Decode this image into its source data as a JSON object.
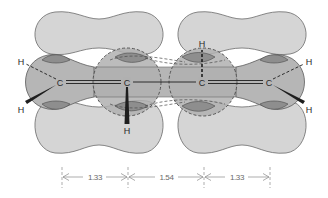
{
  "figure": {
    "molecule": "1,3-butadiene",
    "colors": {
      "background": "#ffffff",
      "pi_lobe_fill": "#d4d4d4",
      "sigma_fill": "#b4b4b4",
      "overlap_fill": "#8c8c8c",
      "outline": "#5a5a5a",
      "bond": "#1e1e1e",
      "dimension": "#808080"
    },
    "atoms": [
      {
        "id": "C1",
        "label": "C",
        "x": 60,
        "y": 82
      },
      {
        "id": "C2",
        "label": "C",
        "x": 127,
        "y": 82
      },
      {
        "id": "C3",
        "label": "C",
        "x": 202,
        "y": 82
      },
      {
        "id": "C4",
        "label": "C",
        "x": 269,
        "y": 82
      }
    ],
    "hydrogens": [
      {
        "id": "H1a",
        "label": "H",
        "attached_to": "C1",
        "x": 21,
        "y": 62,
        "bond": "dashed"
      },
      {
        "id": "H1b",
        "label": "H",
        "attached_to": "C1",
        "x": 21,
        "y": 110,
        "bond": "wedge"
      },
      {
        "id": "H2",
        "label": "H",
        "attached_to": "C2",
        "x": 127,
        "y": 131,
        "bond": "wedge"
      },
      {
        "id": "H3",
        "label": "H",
        "attached_to": "C3",
        "x": 202,
        "y": 44,
        "bond": "dashed"
      },
      {
        "id": "H4a",
        "label": "H",
        "attached_to": "C4",
        "x": 309,
        "y": 62,
        "bond": "dashed"
      },
      {
        "id": "H4b",
        "label": "H",
        "attached_to": "C4",
        "x": 309,
        "y": 110,
        "bond": "wedge"
      }
    ],
    "bonds": [
      {
        "from": "C1",
        "to": "C2",
        "type": "double"
      },
      {
        "from": "C2",
        "to": "C3",
        "type": "single"
      },
      {
        "from": "C3",
        "to": "C4",
        "type": "double"
      }
    ],
    "dimensions": {
      "unit": "Å",
      "segments": [
        {
          "from": "C1",
          "to": "C2",
          "label": "1.33"
        },
        {
          "from": "C2",
          "to": "C3",
          "label": "1.54"
        },
        {
          "from": "C3",
          "to": "C4",
          "label": "1.33"
        }
      ]
    }
  }
}
